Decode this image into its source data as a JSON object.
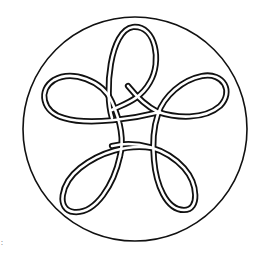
{
  "figure": {
    "colors": {
      "background": "#ffffff",
      "ink": "#111111"
    },
    "circle": {
      "cx": 135,
      "cy": 129,
      "r": 112
    },
    "loops": [
      {
        "name": "top",
        "apex": [
          133,
          25
        ]
      },
      {
        "name": "upper-left",
        "apex": [
          45,
          92
        ]
      },
      {
        "name": "upper-right",
        "apex": [
          224,
          90
        ]
      },
      {
        "name": "lower-left",
        "apex": [
          72,
          212
        ]
      },
      {
        "name": "lower-right",
        "apex": [
          188,
          210
        ]
      }
    ],
    "margin_mark": ":"
  }
}
